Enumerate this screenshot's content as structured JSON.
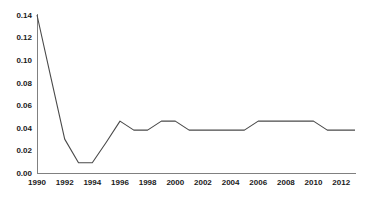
{
  "chart_data": {
    "type": "line",
    "title": "",
    "xlabel": "",
    "ylabel": "",
    "x": [
      1990,
      1991,
      1992,
      1993,
      1994,
      1995,
      1996,
      1997,
      1998,
      1999,
      2000,
      2001,
      2002,
      2003,
      2004,
      2005,
      2006,
      2007,
      2008,
      2009,
      2010,
      2011,
      2012,
      2013
    ],
    "series": [
      {
        "name": "series-1",
        "values": [
          0.14,
          0.085,
          0.03,
          0.009,
          0.009,
          0.027,
          0.046,
          0.038,
          0.038,
          0.046,
          0.046,
          0.038,
          0.038,
          0.038,
          0.038,
          0.038,
          0.046,
          0.046,
          0.046,
          0.046,
          0.046,
          0.038,
          0.038,
          0.038
        ]
      }
    ],
    "xlim": [
      1990,
      2013
    ],
    "ylim": [
      0,
      0.14
    ],
    "x_ticks": [
      1990,
      1992,
      1994,
      1996,
      1998,
      2000,
      2002,
      2004,
      2006,
      2008,
      2010,
      2012
    ],
    "y_ticks": [
      0,
      0.02,
      0.04,
      0.06,
      0.08,
      0.1,
      0.12,
      0.14
    ],
    "y_tick_labels": [
      "0.00",
      "0.02",
      "0.04",
      "0.06",
      "0.08",
      "0.10",
      "0.12",
      "0.14"
    ],
    "grid": false,
    "legend": false,
    "spines": "left-bottom-only",
    "line_color": "#4a4a4a",
    "axis_color": "#808080",
    "label_color": "#1a1a1a",
    "background": "#ffffff"
  }
}
